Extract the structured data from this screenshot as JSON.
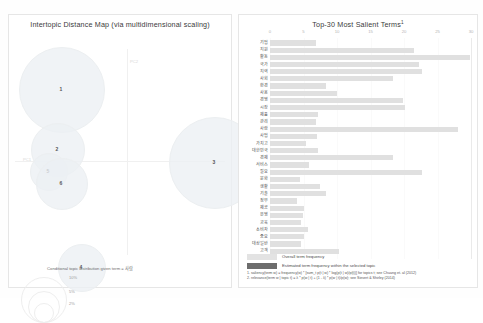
{
  "left_panel": {
    "title": "Intertopic Distance Map (via multidimensional scaling)",
    "axis": {
      "x_label": "PC1",
      "y_label": "PC2"
    },
    "topics": [
      {
        "id": "1",
        "cx": 52,
        "cy": 58,
        "r": 42
      },
      {
        "id": "2",
        "cx": 48,
        "cy": 118,
        "r": 26
      },
      {
        "id": "5",
        "cx": 39,
        "cy": 140,
        "r": 18
      },
      {
        "id": "6",
        "cx": 52,
        "cy": 152,
        "r": 25
      },
      {
        "id": "3",
        "cx": 205,
        "cy": 131,
        "r": 45
      },
      {
        "id": "4",
        "cx": 72,
        "cy": 236,
        "r": 23
      }
    ],
    "size_legend": {
      "caption": "Conditional topic distribution given term = 사람",
      "marks": [
        {
          "label": "2%",
          "r": 9
        },
        {
          "label": "5%",
          "r": 15
        },
        {
          "label": "10%",
          "r": 22
        }
      ]
    }
  },
  "right_panel": {
    "title": "Top-30 Most Salient Terms",
    "title_superscript": "1",
    "legend": [
      {
        "swatch": "overall",
        "label": "Overall term frequency"
      },
      {
        "swatch": "selected",
        "label": "Estimated term frequency within the selected topic"
      }
    ],
    "footnotes": [
      "1. saliency(term w) = frequency(w) * [sum_t p(t | w) * log(p(t | w)/p(t))] for topics t; see Chuang et. al (2012)",
      "2. relevance(term w | topic t) = λ * p(w | t) + (1 - λ) * p(w | t)/p(w); see Sievert & Shirley (2014)"
    ]
  },
  "chart_data": {
    "type": "bar",
    "orientation": "horizontal",
    "title": "Top-30 Most Salient Terms",
    "xlabel": "",
    "ylabel": "",
    "xlim": [
      0,
      30
    ],
    "xticks": [
      0,
      5,
      10,
      15,
      20,
      25,
      30
    ],
    "grid": false,
    "legend_position": "bottom-left",
    "categories": [
      "기업",
      "지원",
      "활동",
      "국가",
      "지역",
      "사회",
      "환경",
      "사용",
      "경영",
      "시장",
      "제품",
      "관리",
      "사람",
      "사업",
      "가치고",
      "대한민국",
      "경제",
      "서비스",
      "필요",
      "문화",
      "생활",
      "기술",
      "정부",
      "제공",
      "운영",
      "교육",
      "소비자",
      "중요",
      "대상일반",
      "고객"
    ],
    "series": [
      {
        "name": "Overall term frequency",
        "values": [
          6.9,
          21.5,
          29.8,
          22.2,
          22.7,
          18.4,
          8.3,
          10.0,
          19.9,
          20.1,
          7.1,
          6.8,
          28.1,
          7.0,
          5.4,
          7.1,
          18.4,
          5.8,
          22.7,
          4.5,
          7.5,
          8.3,
          4.1,
          5.0,
          4.9,
          4.6,
          5.6,
          5.1,
          4.6,
          10.3
        ]
      },
      {
        "name": "Estimated term frequency within the selected topic",
        "values": [
          0,
          0,
          0,
          0,
          0,
          0,
          0,
          0,
          0,
          0,
          0,
          0,
          0,
          0,
          0,
          0,
          0,
          0,
          0,
          0,
          0,
          0,
          0,
          0,
          0,
          0,
          0,
          0,
          0,
          0
        ]
      }
    ]
  }
}
